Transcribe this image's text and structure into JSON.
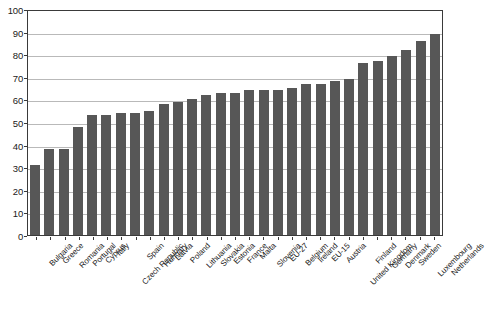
{
  "chart_data": {
    "type": "bar",
    "title": "",
    "subtitle": "",
    "xlabel": "",
    "ylabel": "",
    "ylim": [
      0,
      100
    ],
    "ytick_step": 10,
    "yticks": [
      0,
      10,
      20,
      30,
      40,
      50,
      60,
      70,
      80,
      90,
      100
    ],
    "ytick_labels": [
      "0",
      "10",
      "20",
      "30",
      "40",
      "50",
      "60",
      "70",
      "80",
      "90",
      "100"
    ],
    "grid": true,
    "grid_axis": "y",
    "legend": false,
    "legend_position": "none",
    "bar_color": "#575757",
    "gridline_color": "#b9b9b9",
    "axis_color": "#3a3a3a",
    "background_color": "#ffffff",
    "xtick_label_rotation": -45,
    "sorted": "ascending",
    "categories": [
      "Bulgaria",
      "Greece",
      "Romania",
      "Portugal",
      "Cyprus",
      "Italy",
      "Czech Republic",
      "Spain",
      "Hungary",
      "Latvia",
      "Poland",
      "Lithuania",
      "Slovakia",
      "Estonia",
      "France",
      "Malta",
      "Slovenia",
      "EU-27",
      "Belgium",
      "Ireland",
      "EU-15",
      "Austria",
      "United Kingdom",
      "Finland",
      "Germany",
      "Denmark",
      "Sweden",
      "Luxembourg",
      "Netherlands"
    ],
    "values": [
      31,
      38,
      38,
      48,
      53,
      53,
      54,
      54,
      55,
      58,
      59,
      60,
      62,
      63,
      63,
      64,
      64,
      64,
      65,
      67,
      67,
      68,
      69,
      76,
      77,
      79,
      82,
      86,
      89
    ]
  }
}
